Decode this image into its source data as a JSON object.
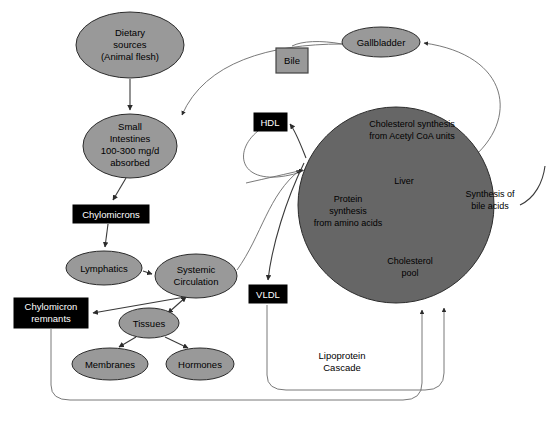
{
  "diagram": {
    "colors": {
      "ellipse_fill": "#999999",
      "liver_fill": "#666666",
      "black_box_fill": "#000000",
      "black_box_text": "#ffffff",
      "gray_box_fill": "#999999",
      "edge_stroke": "#3a3a3a",
      "background": "#ffffff"
    },
    "ellipse_nodes": [
      {
        "id": "dietary-sources",
        "lines": [
          "Dietary",
          "sources",
          "(Animal flesh)"
        ],
        "cx": 130,
        "cy": 45,
        "rx": 54,
        "ry": 33
      },
      {
        "id": "small-intestines",
        "lines": [
          "Small",
          "Intestines",
          "100-300 mg/d",
          "absorbed"
        ],
        "cx": 130,
        "cy": 146,
        "rx": 47,
        "ry": 32
      },
      {
        "id": "lymphatics",
        "lines": [
          "Lymphatics"
        ],
        "cx": 104,
        "cy": 268,
        "rx": 38,
        "ry": 17
      },
      {
        "id": "systemic-circulation",
        "lines": [
          "Systemic",
          "Circulation"
        ],
        "cx": 196,
        "cy": 276,
        "rx": 41,
        "ry": 22
      },
      {
        "id": "tissues",
        "lines": [
          "Tissues"
        ],
        "cx": 149,
        "cy": 323,
        "rx": 30,
        "ry": 15
      },
      {
        "id": "membranes",
        "lines": [
          "Membranes"
        ],
        "cx": 110,
        "cy": 364,
        "rx": 38,
        "ry": 16
      },
      {
        "id": "hormones",
        "lines": [
          "Hormones"
        ],
        "cx": 200,
        "cy": 364,
        "rx": 34,
        "ry": 16
      },
      {
        "id": "gallbladder",
        "lines": [
          "Gallbladder"
        ],
        "cx": 381,
        "cy": 42,
        "rx": 39,
        "ry": 15
      }
    ],
    "black_boxes": [
      {
        "id": "chylomicrons",
        "label": "Chylomicrons",
        "x": 73,
        "y": 205,
        "w": 76,
        "h": 18
      },
      {
        "id": "chylomicron-remnants",
        "lines": [
          "Chylomicron",
          "remnants"
        ],
        "x": 14,
        "y": 298,
        "w": 74,
        "h": 30
      },
      {
        "id": "hdl",
        "label": "HDL",
        "x": 254,
        "y": 113,
        "w": 33,
        "h": 18
      },
      {
        "id": "vldl",
        "label": "VLDL",
        "x": 249,
        "y": 285,
        "w": 38,
        "h": 18
      }
    ],
    "gray_boxes": [
      {
        "id": "bile",
        "label": "Bile",
        "x": 276,
        "y": 48,
        "w": 32,
        "h": 25
      }
    ],
    "liver": {
      "id": "liver",
      "label": "Liver",
      "cx": 396,
      "cy": 205,
      "r": 98,
      "inner_labels": [
        {
          "id": "cholesterol-synthesis",
          "lines": [
            "Cholesterol synthesis",
            "from Acetyl CoA units"
          ],
          "x": 412,
          "y": 132
        },
        {
          "id": "liver-label",
          "lines": [
            "Liver"
          ],
          "x": 404,
          "y": 182
        },
        {
          "id": "protein-synthesis",
          "lines": [
            "Protein",
            "synthesis",
            "from amino acids"
          ],
          "x": 348,
          "y": 205
        },
        {
          "id": "synthesis-bile-acids",
          "lines": [
            "Synthesis of",
            "bile acids"
          ],
          "x": 490,
          "y": 200
        },
        {
          "id": "cholesterol-pool",
          "lines": [
            "Cholesterol",
            "pool"
          ],
          "x": 410,
          "y": 265
        }
      ]
    },
    "plain_labels": [
      {
        "id": "lipoprotein-cascade",
        "lines": [
          "Lipoprotein",
          "Cascade"
        ],
        "x": 342,
        "y": 361
      }
    ]
  }
}
